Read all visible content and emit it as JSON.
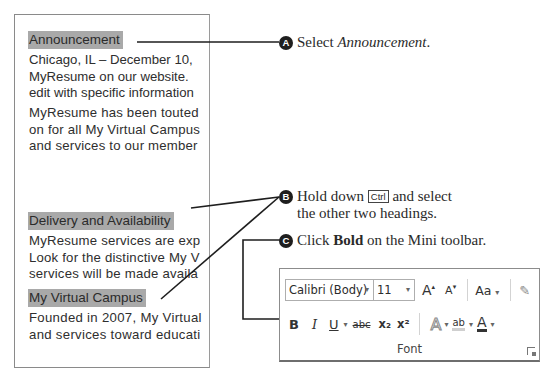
{
  "document": {
    "sections": [
      {
        "heading": "Announcement",
        "paragraphs": [
          [
            "Chicago, IL – December 10,",
            "MyResume on our website.",
            "edit with specific information"
          ],
          [
            "MyResume has been touted",
            "on for all My Virtual Campus",
            "and services to our member"
          ]
        ]
      },
      {
        "heading": "Delivery and Availability",
        "paragraphs": [
          [
            "MyResume services are exp",
            "Look for the distinctive My V",
            "services will be made availa"
          ]
        ]
      },
      {
        "heading": "My Virtual Campus",
        "paragraphs": [
          [
            "Founded in 2007, My Virtual",
            "and services toward educati"
          ]
        ]
      }
    ]
  },
  "steps": {
    "a": {
      "badge": "A",
      "text": "Select ",
      "emphasis": "Announcement",
      "end": "."
    },
    "b": {
      "badge": "B",
      "text1": "Hold down ",
      "key": "Ctrl",
      "text2": " and select",
      "line2": "the other two headings."
    },
    "c": {
      "badge": "C",
      "text1": "Click ",
      "bold": "Bold",
      "text2": " on the Mini toolbar."
    }
  },
  "toolbar": {
    "font_name": "Calibri (Body)",
    "font_size": "11",
    "grow_font": "A",
    "shrink_font": "A",
    "change_case": "Aa",
    "bold": "B",
    "italic": "I",
    "underline": "U",
    "strikethrough": "abc",
    "subscript": "x₂",
    "superscript": "x²",
    "text_effects": "A",
    "highlight": "ab",
    "font_color": "A",
    "group_label": "Font",
    "dropdown_arrow": "▾"
  },
  "colors": {
    "heading_highlight": "#a9a9a9",
    "callout_line": "#1e1e1e",
    "font_color_bar": "#333333"
  }
}
